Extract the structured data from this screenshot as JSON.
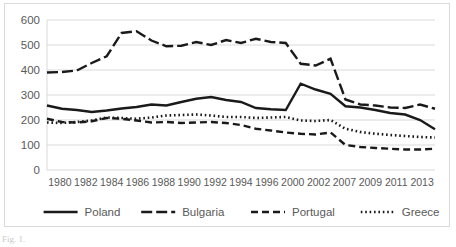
{
  "chart_data": {
    "type": "line",
    "title": "",
    "xlabel": "",
    "ylabel": "",
    "ylim": [
      0,
      600
    ],
    "ytick_labels": [
      "0",
      "100",
      "200",
      "300",
      "400",
      "500",
      "600"
    ],
    "yticks": [
      0,
      100,
      200,
      300,
      400,
      500,
      600
    ],
    "grid": true,
    "legend_position": "bottom",
    "categories": [
      "1980",
      "1981",
      "1982",
      "1983",
      "1984",
      "1985",
      "1986",
      "1987",
      "1988",
      "1989",
      "1990",
      "1991",
      "1992",
      "1993",
      "1994",
      "1995",
      "1996",
      "2000",
      "2001",
      "2002",
      "2007",
      "2008",
      "2009",
      "2010",
      "2011",
      "2012",
      "2013"
    ],
    "xtick_labels": [
      "1980",
      "1982",
      "1984",
      "1986",
      "1988",
      "1990",
      "1992",
      "1994",
      "1996",
      "2000",
      "2002",
      "2007",
      "2009",
      "2011",
      "2013"
    ],
    "series": [
      {
        "name": "Poland",
        "style": "solid",
        "color": "#1a1a1a",
        "values": [
          258,
          245,
          240,
          232,
          238,
          246,
          252,
          262,
          258,
          272,
          285,
          292,
          280,
          272,
          248,
          243,
          240,
          345,
          322,
          305,
          255,
          250,
          240,
          228,
          222,
          200,
          163
        ]
      },
      {
        "name": "Bulgaria",
        "style": "long-dash",
        "color": "#1a1a1a",
        "values": [
          390,
          392,
          398,
          428,
          455,
          548,
          555,
          518,
          495,
          497,
          512,
          500,
          520,
          508,
          525,
          512,
          508,
          425,
          418,
          445,
          282,
          262,
          258,
          250,
          248,
          262,
          245
        ]
      },
      {
        "name": "Portugal",
        "style": "dash",
        "color": "#1a1a1a",
        "values": [
          205,
          192,
          190,
          195,
          208,
          205,
          198,
          190,
          192,
          188,
          190,
          192,
          188,
          180,
          165,
          158,
          150,
          145,
          142,
          150,
          100,
          92,
          88,
          85,
          82,
          82,
          85
        ]
      },
      {
        "name": "Greece",
        "style": "dot",
        "color": "#1a1a1a",
        "values": [
          190,
          188,
          192,
          198,
          210,
          208,
          205,
          210,
          218,
          220,
          222,
          218,
          212,
          212,
          208,
          210,
          212,
          198,
          196,
          200,
          165,
          152,
          145,
          140,
          136,
          132,
          130
        ]
      }
    ]
  },
  "legend": {
    "items": [
      {
        "label": "Poland",
        "style": "solid"
      },
      {
        "label": "Bulgaria",
        "style": "long-dash"
      },
      {
        "label": "Portugal",
        "style": "dash"
      },
      {
        "label": "Greece",
        "style": "dot"
      }
    ]
  },
  "caption": {
    "text": "Fig. 1."
  }
}
